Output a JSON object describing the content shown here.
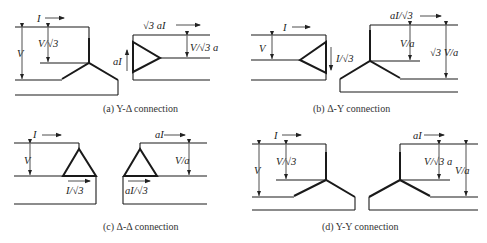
{
  "figure": {
    "panels": [
      {
        "id": "a",
        "caption": "(a) Y-Δ connection",
        "primary": {
          "type": "Y",
          "current": "I",
          "line_voltage": "V",
          "phase_voltage": "V/√3"
        },
        "secondary": {
          "type": "Δ",
          "current": "√3 aI",
          "phase_current": "aI",
          "voltage": "V/√3 a"
        }
      },
      {
        "id": "b",
        "caption": "(b) Δ-Y connection",
        "primary": {
          "type": "Δ",
          "current": "I",
          "voltage": "V",
          "phase_current": "I/√3"
        },
        "secondary": {
          "type": "Y",
          "current": "aI/√3",
          "phase_voltage": "V/a",
          "line_voltage": "√3 V/a"
        }
      },
      {
        "id": "c",
        "caption": "(c) Δ-Δ connection",
        "primary": {
          "type": "Δ",
          "current": "I",
          "voltage": "V",
          "phase_current": "I/√3"
        },
        "secondary": {
          "type": "Δ",
          "current": "aI",
          "voltage": "V/a",
          "phase_current": "aI/√3"
        }
      },
      {
        "id": "d",
        "caption": "(d) Y-Y connection",
        "primary": {
          "type": "Y",
          "current": "I",
          "line_voltage": "V",
          "phase_voltage": "V/√3"
        },
        "secondary": {
          "type": "Y",
          "current": "aI",
          "phase_voltage": "V/√3 a",
          "line_voltage": "V/a"
        }
      }
    ]
  }
}
